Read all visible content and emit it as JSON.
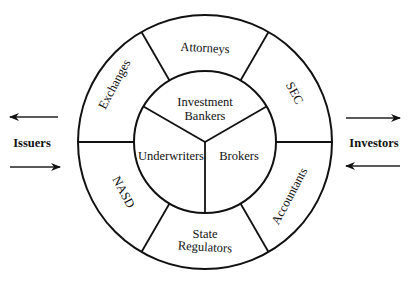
{
  "diagram": {
    "type": "concentric-ring",
    "center": {
      "x": 205,
      "y": 142
    },
    "outer_radius": 127,
    "inner_radius": 71,
    "inner_core": {
      "segments": [
        {
          "label_lines": [
            "Investment",
            "Bankers"
          ],
          "position": "top"
        },
        {
          "label": "Underwriters",
          "position": "left"
        },
        {
          "label": "Brokers",
          "position": "right"
        }
      ]
    },
    "outer_ring": {
      "segments": [
        {
          "label": "Attorneys",
          "position": "top"
        },
        {
          "label": "SEC",
          "position": "upper-right"
        },
        {
          "label": "Accountants",
          "position": "lower-right"
        },
        {
          "label_lines": [
            "State",
            "Regulators"
          ],
          "position": "bottom"
        },
        {
          "label": "NASD",
          "position": "lower-left"
        },
        {
          "label": "Exchanges",
          "position": "upper-left"
        }
      ]
    },
    "left_side": {
      "label": "Issuers",
      "arrows": [
        "outward-left",
        "inward-right"
      ]
    },
    "right_side": {
      "label": "Investors",
      "arrows": [
        "outward-right",
        "inward-left"
      ]
    },
    "colors": {
      "line": "#111111",
      "text": "#111111",
      "background": "#ffffff"
    }
  }
}
